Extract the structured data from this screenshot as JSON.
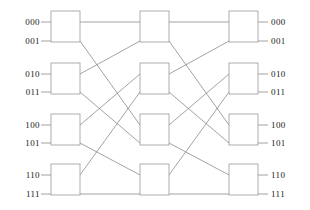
{
  "diagram": {
    "type": "multistage-interconnection-network",
    "width": 310,
    "height": 210,
    "background": "#ffffff",
    "line_color": "#8c8c8c",
    "box_stroke": "#9a9a9a",
    "box_fill": "#ffffff",
    "text_color": "#1a1a1a",
    "line_width": 0.8,
    "stage_count": 3,
    "switches_per_stage": 4,
    "port_count": 8
  },
  "inputs": [
    {
      "label": "000",
      "y": 22
    },
    {
      "label": "001",
      "y": 41
    },
    {
      "label": "010",
      "y": 74
    },
    {
      "label": "011",
      "y": 92
    },
    {
      "label": "100",
      "y": 125
    },
    {
      "label": "101",
      "y": 143
    },
    {
      "label": "110",
      "y": 175
    },
    {
      "label": "111",
      "y": 194
    }
  ],
  "outputs": [
    {
      "label": "000",
      "y": 22
    },
    {
      "label": "001",
      "y": 41
    },
    {
      "label": "010",
      "y": 74
    },
    {
      "label": "011",
      "y": 92
    },
    {
      "label": "100",
      "y": 125
    },
    {
      "label": "101",
      "y": 143
    },
    {
      "label": "110",
      "y": 175
    },
    {
      "label": "111",
      "y": 194
    }
  ],
  "stages": [
    {
      "name": "stage-1",
      "x": 51,
      "w": 29,
      "switches": [
        {
          "name": "switch-1-1",
          "y": 11,
          "h": 31
        },
        {
          "name": "switch-1-2",
          "y": 63,
          "h": 31
        },
        {
          "name": "switch-1-3",
          "y": 114,
          "h": 31
        },
        {
          "name": "switch-1-4",
          "y": 164,
          "h": 31
        }
      ]
    },
    {
      "name": "stage-2",
      "x": 140,
      "w": 29,
      "switches": [
        {
          "name": "switch-2-1",
          "y": 11,
          "h": 31
        },
        {
          "name": "switch-2-2",
          "y": 63,
          "h": 31
        },
        {
          "name": "switch-2-3",
          "y": 114,
          "h": 31
        },
        {
          "name": "switch-2-4",
          "y": 164,
          "h": 31
        }
      ]
    },
    {
      "name": "stage-3",
      "x": 229,
      "w": 29,
      "switches": [
        {
          "name": "switch-3-1",
          "y": 11,
          "h": 31
        },
        {
          "name": "switch-3-2",
          "y": 63,
          "h": 31
        },
        {
          "name": "switch-3-3",
          "y": 114,
          "h": 31
        },
        {
          "name": "switch-3-4",
          "y": 164,
          "h": 31
        }
      ]
    }
  ],
  "geometry": {
    "port_y": [
      22,
      41,
      74,
      92,
      125,
      143,
      175,
      194
    ],
    "input_label_x": 40,
    "output_label_x": 270,
    "input_stub_x0": 41,
    "output_stub_x1": 268,
    "link_left_x": 80,
    "link_mid_left_x": 140,
    "link_mid_right_x": 169,
    "link_right_x": 229
  },
  "links_stage1_to_stage2": [
    {
      "from_port": 0,
      "to_port": 0
    },
    {
      "from_port": 1,
      "to_port": 4
    },
    {
      "from_port": 2,
      "to_port": 1
    },
    {
      "from_port": 3,
      "to_port": 5
    },
    {
      "from_port": 4,
      "to_port": 2
    },
    {
      "from_port": 5,
      "to_port": 6
    },
    {
      "from_port": 6,
      "to_port": 3
    },
    {
      "from_port": 7,
      "to_port": 7
    }
  ],
  "links_stage2_to_stage3": [
    {
      "from_port": 0,
      "to_port": 0
    },
    {
      "from_port": 1,
      "to_port": 4
    },
    {
      "from_port": 2,
      "to_port": 1
    },
    {
      "from_port": 3,
      "to_port": 5
    },
    {
      "from_port": 4,
      "to_port": 2
    },
    {
      "from_port": 5,
      "to_port": 6
    },
    {
      "from_port": 6,
      "to_port": 3
    },
    {
      "from_port": 7,
      "to_port": 7
    }
  ]
}
